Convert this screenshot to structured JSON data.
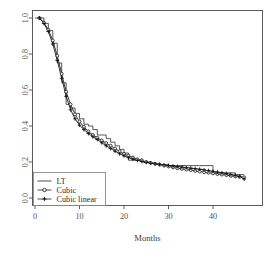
{
  "chart_data": {
    "type": "line",
    "title": "",
    "xlabel": "Months",
    "ylabel": "",
    "xlim": [
      0,
      48
    ],
    "ylim": [
      0.0,
      1.0
    ],
    "grid": false,
    "legend_position": "bottom-left",
    "xticks": [
      0,
      10,
      20,
      30,
      40
    ],
    "xtick_labels": [
      "0",
      "10",
      "20",
      "30",
      "40"
    ],
    "yticks": [
      0.0,
      0.2,
      0.4,
      0.6,
      0.8,
      1.0
    ],
    "ytick_labels": [
      "0.0",
      "0.2",
      "0.4",
      "0.6",
      "0.8",
      "1.0"
    ],
    "series": [
      {
        "name": "LT",
        "style": "step",
        "marker": "none",
        "x": [
          0,
          1,
          2,
          3,
          4,
          5,
          6,
          7,
          8,
          9,
          10,
          11,
          12,
          13,
          14,
          15,
          16,
          17,
          18,
          19,
          20,
          21,
          22,
          23,
          24,
          25,
          26,
          27,
          28,
          29,
          30,
          31,
          32,
          34,
          37,
          40,
          43,
          45,
          47
        ],
        "values": [
          1.0,
          1.0,
          0.97,
          0.93,
          0.86,
          0.75,
          0.64,
          0.52,
          0.5,
          0.47,
          0.44,
          0.41,
          0.4,
          0.38,
          0.35,
          0.35,
          0.33,
          0.31,
          0.29,
          0.27,
          0.25,
          0.21,
          0.21,
          0.21,
          0.2,
          0.2,
          0.195,
          0.19,
          0.185,
          0.185,
          0.18,
          0.18,
          0.18,
          0.18,
          0.18,
          0.14,
          0.14,
          0.13,
          0.13
        ]
      },
      {
        "name": "Cubic",
        "style": "line",
        "marker": "circle",
        "x": [
          1,
          2,
          3,
          4,
          5,
          6,
          7,
          8,
          9,
          10,
          11,
          12,
          13,
          14,
          15,
          16,
          17,
          18,
          19,
          20,
          21,
          22,
          23,
          24,
          25,
          26,
          27,
          28,
          29,
          30,
          31,
          32,
          33,
          34,
          35,
          36,
          37,
          38,
          39,
          40,
          41,
          42,
          43,
          44,
          45,
          46,
          47
        ],
        "values": [
          1.0,
          0.975,
          0.935,
          0.875,
          0.79,
          0.69,
          0.59,
          0.52,
          0.465,
          0.425,
          0.395,
          0.37,
          0.35,
          0.335,
          0.32,
          0.305,
          0.29,
          0.275,
          0.26,
          0.245,
          0.235,
          0.225,
          0.215,
          0.21,
          0.2,
          0.195,
          0.19,
          0.185,
          0.18,
          0.175,
          0.17,
          0.165,
          0.162,
          0.158,
          0.155,
          0.15,
          0.147,
          0.143,
          0.14,
          0.137,
          0.133,
          0.13,
          0.127,
          0.123,
          0.12,
          0.117,
          0.115
        ]
      },
      {
        "name": "Cubic linear",
        "style": "line",
        "marker": "plus",
        "x": [
          1,
          2,
          3,
          4,
          5,
          6,
          7,
          8,
          9,
          10,
          11,
          12,
          13,
          14,
          15,
          16,
          17,
          18,
          19,
          20,
          21,
          22,
          23,
          24,
          25,
          26,
          27,
          28,
          29,
          30,
          31,
          32,
          33,
          34,
          35,
          36,
          37,
          38,
          39,
          40,
          41,
          42,
          43,
          44,
          45,
          46,
          47
        ],
        "values": [
          1.0,
          0.97,
          0.925,
          0.855,
          0.765,
          0.665,
          0.565,
          0.49,
          0.44,
          0.405,
          0.38,
          0.358,
          0.34,
          0.325,
          0.307,
          0.29,
          0.275,
          0.26,
          0.246,
          0.234,
          0.224,
          0.216,
          0.209,
          0.203,
          0.198,
          0.193,
          0.19,
          0.187,
          0.184,
          0.181,
          0.178,
          0.175,
          0.172,
          0.169,
          0.166,
          0.163,
          0.16,
          0.156,
          0.152,
          0.148,
          0.144,
          0.14,
          0.136,
          0.131,
          0.126,
          0.12,
          0.105
        ]
      }
    ]
  },
  "legend": {
    "entries": [
      {
        "label": "LT",
        "marker": "line"
      },
      {
        "label": "Cubic",
        "marker": "circle"
      },
      {
        "label": "Cubic linear",
        "marker": "plus"
      }
    ]
  },
  "axes": {
    "x_title": "Months"
  }
}
